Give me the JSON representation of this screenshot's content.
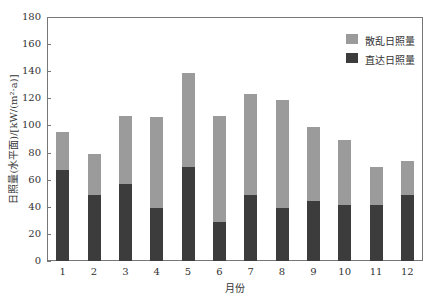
{
  "chart_data": {
    "type": "bar",
    "stacked": true,
    "title": "",
    "xlabel": "月份",
    "ylabel": "日照量(水平面)/[kW/(m²·a)]",
    "ylim": [
      0,
      180
    ],
    "yticks": [
      0,
      20,
      40,
      60,
      80,
      100,
      120,
      140,
      160,
      180
    ],
    "categories": [
      "1",
      "2",
      "3",
      "4",
      "5",
      "6",
      "7",
      "8",
      "9",
      "10",
      "11",
      "12"
    ],
    "series": [
      {
        "name": "直达日照量",
        "color": "#3c3c3c",
        "values": [
          67,
          49,
          57,
          39,
          69,
          29,
          49,
          39,
          44,
          41,
          41,
          49
        ]
      },
      {
        "name": "散乱日照量",
        "color": "#9b9b9b",
        "values": [
          28,
          30,
          50,
          67,
          70,
          78,
          74,
          80,
          55,
          48,
          28,
          25
        ]
      }
    ],
    "totals": [
      95,
      79,
      107,
      106,
      139,
      107,
      123,
      119,
      99,
      89,
      69,
      74
    ],
    "legend": {
      "position": "upper right",
      "entries": [
        "散乱日照量",
        "直达日照量"
      ]
    },
    "grid": false
  },
  "labels": {
    "xlabel": "月份",
    "ylabel": "日照量(水平面)/[kW/(m²·a)]",
    "legend_diffuse": "散乱日照量",
    "legend_direct": "直达日照量"
  }
}
